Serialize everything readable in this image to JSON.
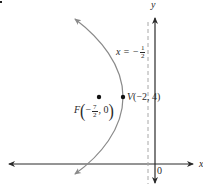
{
  "figure": {
    "type": "parabola-graph",
    "axes": {
      "x_label": "x",
      "y_label": "y",
      "origin_label": "0"
    },
    "directrix": {
      "label_lhs": "x = −",
      "frac_num": "1",
      "frac_den": "2",
      "equation": "x = -1/2",
      "style": "dashed"
    },
    "vertex": {
      "label": "V(−2, 4)",
      "letter": "V",
      "coords": "(−2, 4)"
    },
    "focus": {
      "letter": "F",
      "frac_sign": "−",
      "frac_num": "7",
      "frac_den": "2",
      "coords_rest": ", 0",
      "equation": "F(-7/2, 0)"
    },
    "colors": {
      "axes": "#2a2a2a",
      "parabola": "#8a8a8a",
      "directrix": "#a8a8a8",
      "points": "#111111"
    }
  }
}
